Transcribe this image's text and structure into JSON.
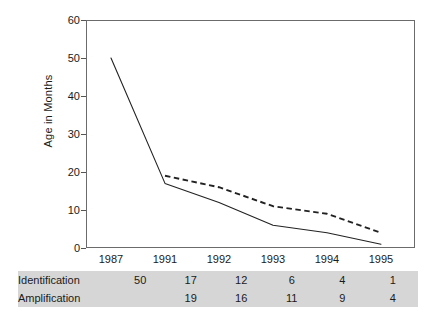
{
  "chart_data": {
    "type": "line",
    "title": "",
    "xlabel": "",
    "ylabel": "Age in Months",
    "categories": [
      "1987",
      "1991",
      "1992",
      "1993",
      "1994",
      "1995"
    ],
    "ylim": [
      0,
      60
    ],
    "yticks": [
      0,
      10,
      20,
      30,
      40,
      50,
      60
    ],
    "grid": false,
    "legend": "none",
    "series": [
      {
        "name": "Identification",
        "style": "solid",
        "color": "#222222",
        "values": [
          50,
          17,
          12,
          6,
          4,
          1
        ]
      },
      {
        "name": "Amplification",
        "style": "dashed",
        "color": "#222222",
        "values": [
          null,
          19,
          16,
          11,
          9,
          4
        ]
      }
    ]
  },
  "table": {
    "header": [
      "",
      "1987",
      "1991",
      "1992",
      "1993",
      "1994",
      "1995"
    ],
    "rows": [
      {
        "label": "Identification",
        "values": [
          "50",
          "17",
          "12",
          "6",
          "4",
          "1"
        ]
      },
      {
        "label": "Amplification",
        "values": [
          "",
          "19",
          "16",
          "11",
          "9",
          "4"
        ]
      }
    ],
    "background": "#d6d6d6"
  },
  "axis": {
    "y_title": "Age in Months",
    "y_labels": [
      "60",
      "50",
      "40",
      "30",
      "20",
      "10",
      "0"
    ],
    "x_labels": [
      "1987",
      "1991",
      "1992",
      "1993",
      "1994",
      "1995"
    ]
  }
}
